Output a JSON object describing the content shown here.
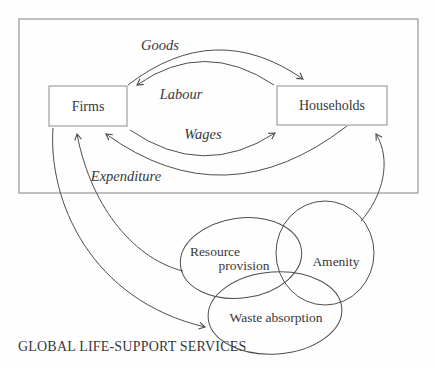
{
  "colors": {
    "background": "#fefefe",
    "line": "#4d4d4d",
    "box-border": "#979797",
    "text": "#383838"
  },
  "economy": {
    "firms_label": "Firms",
    "households_label": "Households",
    "flows": [
      {
        "label": "Goods",
        "from": "Firms",
        "to": "Households"
      },
      {
        "label": "Labour",
        "from": "Households",
        "to": "Firms"
      },
      {
        "label": "Wages",
        "from": "Firms",
        "to": "Households"
      },
      {
        "label": "Expenditure",
        "from": "Households",
        "to": "Firms"
      }
    ]
  },
  "environment": {
    "caption": "GLOBAL LIFE-SUPPORT SERVICES",
    "services": [
      {
        "label": "Resource provision",
        "lines": [
          "Resource",
          "provision"
        ]
      },
      {
        "label": "Amenity",
        "lines": [
          "Amenity"
        ]
      },
      {
        "label": "Waste absorption",
        "lines": [
          "Waste absorption"
        ]
      }
    ],
    "links": [
      {
        "from": "Resource provision",
        "to": "Firms"
      },
      {
        "from": "Firms",
        "to": "Waste absorption"
      },
      {
        "from": "Amenity",
        "to": "Households"
      }
    ]
  }
}
